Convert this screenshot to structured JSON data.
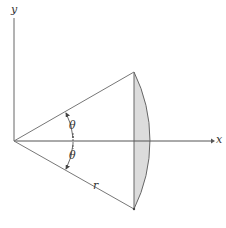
{
  "diagram": {
    "labels": {
      "y_axis": "y",
      "x_axis": "x",
      "theta_upper": "θ",
      "theta_lower": "θ",
      "radius": "r"
    },
    "colors": {
      "lines": "#555555",
      "fill": "#dcdcdc"
    }
  }
}
